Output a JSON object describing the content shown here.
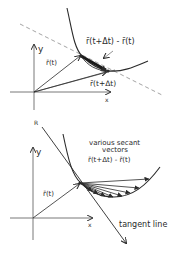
{
  "top_diagram": {
    "axis_x_label": "x",
    "axis_y_label": "y",
    "vector_r_t_label": "r̄(t)",
    "vector_r_t_dt_label": "r̄(t+Δt)",
    "difference_label": "r̄(t+Δt) - r̄(t)",
    "stray_mark": "R"
  },
  "bottom_diagram": {
    "axis_x_label": "x",
    "axis_y_label": "y",
    "vector_r_t_label": "r̄(t)",
    "secant_label_line1": "various secant",
    "secant_label_line2": "vectors",
    "secant_label_line3": "r̄(t+Δt) - r̄(t)",
    "tangent_label": "tangent line"
  },
  "colors": {
    "ink": "#2a2a2a",
    "dashed": "#9a9a9a",
    "background": "#ffffff"
  }
}
